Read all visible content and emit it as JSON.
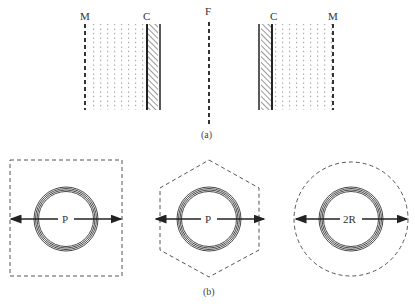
{
  "part_a": {
    "caption": "(a)",
    "labels": {
      "left_m": "M",
      "left_c": "C",
      "center_f": "F",
      "right_c": "C",
      "right_m": "M"
    },
    "description": "Symmetric cell walls C (hatched) with dotted region extending to dashed lines M; dashed midline F"
  },
  "part_b": {
    "caption": "(b)",
    "shapes": [
      {
        "name": "square",
        "boundary": "dashed square",
        "label": "P"
      },
      {
        "name": "hexagon",
        "boundary": "dashed hexagon",
        "label": "P"
      },
      {
        "name": "circle",
        "boundary": "dashed circle",
        "label": "2R"
      }
    ]
  },
  "colors": {
    "stroke": "#222222",
    "dashed": "#555555",
    "dots": "#9a9a9a",
    "ring": "#333333",
    "background": "#ffffff"
  }
}
